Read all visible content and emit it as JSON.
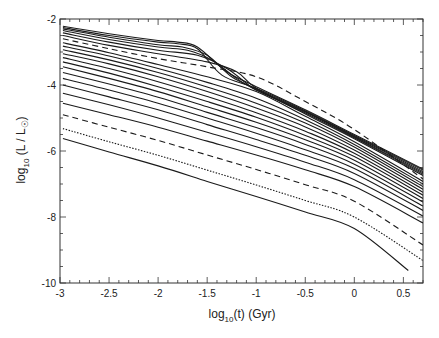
{
  "chart_data": {
    "type": "line",
    "title": "",
    "xlabel": "log10(t)  (Gyr)",
    "ylabel": "log10 (L / L☉)",
    "xlabel_parts": {
      "base": "log",
      "sub": "10",
      "rest": "(t)  (Gyr)"
    },
    "ylabel_parts": {
      "base": "log",
      "sub": "10",
      "rest": " (L / L",
      "sun": "☉",
      "close": ")"
    },
    "xlim": [
      -3,
      0.7
    ],
    "ylim": [
      -10,
      -2
    ],
    "x_ticks": [
      -3,
      -2.5,
      -2,
      -1.5,
      -1,
      -0.5,
      0,
      0.5
    ],
    "x_tick_labels": [
      "-3",
      "-2.5",
      "-2",
      "-1.5",
      "-1",
      "-0.5",
      "0",
      "0.5"
    ],
    "y_ticks": [
      -2,
      -4,
      -6,
      -8,
      -10
    ],
    "y_tick_labels": [
      "-2",
      "-4",
      "-6",
      "-8",
      "-10"
    ],
    "grid": false,
    "legend": null,
    "series": [
      {
        "name": "track-1",
        "style": "solid",
        "x": [
          -2.97,
          -2.5,
          -2.0,
          -1.8,
          -1.6,
          -1.3,
          -1.0,
          -0.5,
          0.0,
          0.7
        ],
        "y": [
          -2.22,
          -2.45,
          -2.65,
          -2.7,
          -2.85,
          -3.6,
          -4.05,
          -4.75,
          -5.5,
          -6.55
        ]
      },
      {
        "name": "track-2",
        "style": "solid",
        "x": [
          -2.97,
          -2.5,
          -2.0,
          -1.8,
          -1.6,
          -1.35,
          -1.0,
          -0.5,
          0.0,
          0.7
        ],
        "y": [
          -2.26,
          -2.5,
          -2.7,
          -2.75,
          -2.9,
          -3.7,
          -4.1,
          -4.78,
          -5.53,
          -6.58
        ]
      },
      {
        "name": "track-3",
        "style": "solid",
        "x": [
          -2.97,
          -2.5,
          -2.0,
          -1.75,
          -1.5,
          -1.25,
          -1.0,
          -0.5,
          0.0,
          0.7
        ],
        "y": [
          -2.3,
          -2.55,
          -2.78,
          -2.85,
          -3.1,
          -3.75,
          -4.12,
          -4.8,
          -5.55,
          -6.62
        ]
      },
      {
        "name": "track-4",
        "style": "solid",
        "x": [
          -2.97,
          -2.5,
          -2.0,
          -1.7,
          -1.45,
          -1.2,
          -1.0,
          -0.5,
          0.0,
          0.7
        ],
        "y": [
          -2.35,
          -2.62,
          -2.85,
          -2.95,
          -3.25,
          -3.8,
          -4.15,
          -4.82,
          -5.58,
          -6.66
        ]
      },
      {
        "name": "track-5",
        "style": "solid",
        "x": [
          -2.97,
          -2.5,
          -2.0,
          -1.6,
          -1.3,
          -1.1,
          -1.0,
          -0.5,
          0.0,
          0.7
        ],
        "y": [
          -2.42,
          -2.7,
          -2.95,
          -3.1,
          -3.5,
          -3.95,
          -4.15,
          -4.85,
          -5.6,
          -6.7
        ]
      },
      {
        "name": "track-6",
        "style": "solid",
        "x": [
          -2.97,
          -2.5,
          -2.0,
          -1.5,
          -1.2,
          -1.0,
          -0.5,
          0.0,
          0.7
        ],
        "y": [
          -2.5,
          -2.8,
          -3.05,
          -3.3,
          -3.6,
          -4.1,
          -4.88,
          -5.63,
          -6.74
        ]
      },
      {
        "name": "track-7-dashed",
        "style": "dashed",
        "x": [
          -2.97,
          -2.5,
          -2.0,
          -1.5,
          -1.0,
          -0.5,
          0.0,
          0.7
        ],
        "y": [
          -2.6,
          -2.9,
          -3.2,
          -3.45,
          -3.75,
          -4.5,
          -5.35,
          -6.85
        ]
      },
      {
        "name": "track-8",
        "style": "solid",
        "x": [
          -2.97,
          -2.5,
          -2.0,
          -1.5,
          -1.0,
          -0.5,
          0.0,
          0.7
        ],
        "y": [
          -2.72,
          -3.02,
          -3.38,
          -3.75,
          -4.2,
          -4.95,
          -5.72,
          -6.92
        ]
      },
      {
        "name": "track-9",
        "style": "solid",
        "x": [
          -2.97,
          -2.5,
          -2.0,
          -1.5,
          -1.0,
          -0.5,
          0.0,
          0.7
        ],
        "y": [
          -2.82,
          -3.12,
          -3.5,
          -3.92,
          -4.4,
          -5.05,
          -5.8,
          -7.0
        ]
      },
      {
        "name": "track-10",
        "style": "solid",
        "x": [
          -2.97,
          -2.5,
          -2.0,
          -1.5,
          -1.0,
          -0.5,
          0.0,
          0.7
        ],
        "y": [
          -2.93,
          -3.24,
          -3.62,
          -4.06,
          -4.55,
          -5.15,
          -5.88,
          -7.08
        ]
      },
      {
        "name": "track-11",
        "style": "solid",
        "x": [
          -2.97,
          -2.5,
          -2.0,
          -1.5,
          -1.0,
          -0.5,
          0.0,
          0.7
        ],
        "y": [
          -3.05,
          -3.36,
          -3.75,
          -4.2,
          -4.7,
          -5.27,
          -5.97,
          -7.16
        ]
      },
      {
        "name": "track-12",
        "style": "solid",
        "x": [
          -2.97,
          -2.5,
          -2.0,
          -1.5,
          -1.0,
          -0.5,
          0.0,
          0.7
        ],
        "y": [
          -3.17,
          -3.5,
          -3.9,
          -4.35,
          -4.84,
          -5.4,
          -6.07,
          -7.25
        ]
      },
      {
        "name": "track-13",
        "style": "solid",
        "x": [
          -2.97,
          -2.5,
          -2.0,
          -1.5,
          -1.0,
          -0.5,
          0.0,
          0.7
        ],
        "y": [
          -3.3,
          -3.64,
          -4.05,
          -4.5,
          -4.98,
          -5.53,
          -6.17,
          -7.34
        ]
      },
      {
        "name": "track-14",
        "style": "solid",
        "x": [
          -2.97,
          -2.5,
          -2.0,
          -1.5,
          -1.0,
          -0.5,
          0.0,
          0.7
        ],
        "y": [
          -3.45,
          -3.8,
          -4.2,
          -4.66,
          -5.13,
          -5.66,
          -6.28,
          -7.44
        ]
      },
      {
        "name": "track-15",
        "style": "solid",
        "x": [
          -2.97,
          -2.5,
          -2.0,
          -1.5,
          -1.0,
          -0.5,
          0.0,
          0.7
        ],
        "y": [
          -3.62,
          -3.97,
          -4.37,
          -4.83,
          -5.29,
          -5.8,
          -6.4,
          -7.55
        ]
      },
      {
        "name": "track-16",
        "style": "solid",
        "x": [
          -2.97,
          -2.5,
          -2.0,
          -1.5,
          -1.0,
          -0.5,
          0.0,
          0.7
        ],
        "y": [
          -3.8,
          -4.15,
          -4.55,
          -5.0,
          -5.46,
          -5.96,
          -6.53,
          -7.67
        ]
      },
      {
        "name": "track-17",
        "style": "solid",
        "x": [
          -2.97,
          -2.5,
          -2.0,
          -1.5,
          -1.0,
          -0.5,
          0.0,
          0.7
        ],
        "y": [
          -4.0,
          -4.36,
          -4.75,
          -5.2,
          -5.65,
          -6.13,
          -6.68,
          -7.8
        ]
      },
      {
        "name": "track-18",
        "style": "solid",
        "x": [
          -2.97,
          -2.5,
          -2.0,
          -1.5,
          -1.0,
          -0.5,
          0.0,
          0.7
        ],
        "y": [
          -4.25,
          -4.6,
          -5.0,
          -5.43,
          -5.87,
          -6.34,
          -6.87,
          -7.97
        ]
      },
      {
        "name": "track-19",
        "style": "solid",
        "x": [
          -2.97,
          -2.5,
          -2.0,
          -1.5,
          -1.0,
          -0.5,
          0.0,
          0.7
        ],
        "y": [
          -4.55,
          -4.9,
          -5.28,
          -5.7,
          -6.12,
          -6.57,
          -7.08,
          -8.18
        ]
      },
      {
        "name": "track-20-dashed",
        "style": "dashed",
        "x": [
          -2.97,
          -2.5,
          -2.0,
          -1.5,
          -1.0,
          -0.5,
          0.0,
          0.7
        ],
        "y": [
          -4.9,
          -5.28,
          -5.68,
          -6.12,
          -6.56,
          -7.02,
          -7.52,
          -8.85
        ]
      },
      {
        "name": "track-21-dotted",
        "style": "dotted",
        "x": [
          -2.97,
          -2.5,
          -2.0,
          -1.5,
          -1.0,
          -0.5,
          0.0,
          0.7
        ],
        "y": [
          -5.32,
          -5.72,
          -6.13,
          -6.58,
          -7.03,
          -7.5,
          -8.0,
          -9.32
        ]
      },
      {
        "name": "track-22",
        "style": "solid",
        "x": [
          -2.97,
          -2.5,
          -2.0,
          -1.5,
          -1.0,
          -0.5,
          0.0,
          0.55
        ],
        "y": [
          -5.62,
          -6.03,
          -6.45,
          -6.92,
          -7.38,
          -7.85,
          -8.35,
          -9.62
        ]
      }
    ]
  }
}
